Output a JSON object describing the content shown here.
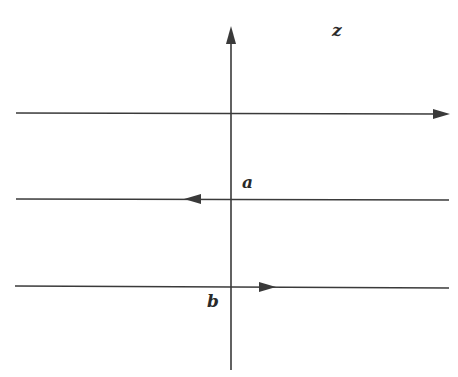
{
  "diagram": {
    "labels": {
      "z": "z",
      "a": "a",
      "b": "b"
    },
    "colors": {
      "stroke": "#3a3a3a",
      "background": "#ffffff"
    },
    "elements": [
      {
        "type": "vertical-axis",
        "direction": "up",
        "label": "z"
      },
      {
        "type": "horizontal-line",
        "position": "top",
        "arrow_direction": "right"
      },
      {
        "type": "horizontal-line",
        "position": "middle",
        "arrow_direction": "left",
        "label": "a"
      },
      {
        "type": "horizontal-line",
        "position": "bottom",
        "arrow_direction": "right",
        "label": "b"
      }
    ]
  }
}
